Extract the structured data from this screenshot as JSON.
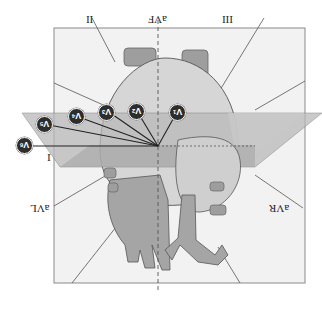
{
  "diagram": {
    "orientation": "upside-down",
    "colors": {
      "background": "#ffffff",
      "frontal_panel": "#f2f2f2",
      "horizontal_plane": "#b9b9b9",
      "horizontal_plane_dark": "#a3a3a3",
      "heart_light": "#d6d6d6",
      "heart_mid": "#c2c2c2",
      "vessels": "#9e9e9e",
      "lead_marker": "#2d2d2d",
      "line": "#333333"
    },
    "limb_leads": {
      "I": "I",
      "II": "II",
      "III": "III",
      "aVR": "aVR",
      "aVL": "aVL",
      "aVF": "aVF"
    },
    "chest_leads": [
      {
        "id": "V1",
        "base": "V",
        "sub": "1"
      },
      {
        "id": "V2",
        "base": "V",
        "sub": "2"
      },
      {
        "id": "V3",
        "base": "V",
        "sub": "3"
      },
      {
        "id": "V4",
        "base": "V",
        "sub": "4"
      },
      {
        "id": "V5",
        "base": "V",
        "sub": "5"
      },
      {
        "id": "V6",
        "base": "V",
        "sub": "6"
      }
    ]
  }
}
